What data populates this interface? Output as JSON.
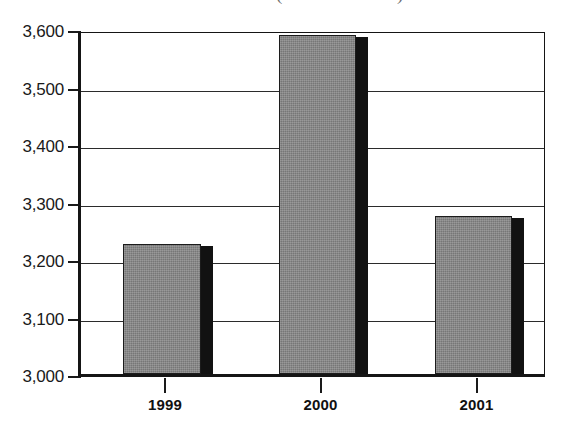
{
  "chart_data": {
    "type": "bar",
    "title": "(million dollars)",
    "xlabel": "",
    "ylabel": "",
    "categories": [
      "1999",
      "2000",
      "2001"
    ],
    "values": [
      3226,
      3589,
      3274
    ],
    "series": [
      {
        "name": "",
        "values": [
          3226,
          3589,
          3274
        ]
      }
    ],
    "ylim": [
      3000,
      3600
    ],
    "ytick_labels": [
      "3,600",
      "3,500",
      "3,400",
      "3,300",
      "3,200",
      "3,100",
      "3,000"
    ],
    "ytick_values": [
      3600,
      3500,
      3400,
      3300,
      3200,
      3100,
      3000
    ],
    "grid": true,
    "legend": null,
    "colors": {
      "bar_fill": "#858585",
      "bar_shadow": "#121212",
      "bar_outline": "#1c1c1c",
      "axis": "#151515",
      "gridline": "#2b2b2b",
      "text": "#1a1a1a",
      "background": "#ffffff"
    }
  }
}
